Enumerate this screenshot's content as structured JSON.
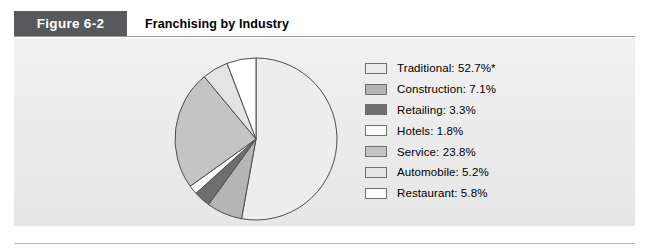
{
  "figure": {
    "badge_label": "Figure 6-2",
    "title": "Franchising by Industry"
  },
  "colors": {
    "badge_background": "#58595b",
    "panel_background": "#eeeeee",
    "rule": "#9a9a9a",
    "slice_outline": "#4d4d4d"
  },
  "chart_data": {
    "type": "pie",
    "title": "Franchising by Industry",
    "xlabel": "",
    "ylabel": "",
    "grid": false,
    "legend_position": "right",
    "start_angle_deg": 0,
    "direction": "clockwise",
    "units": "percent",
    "total": 99.7,
    "labels": [
      "Traditional",
      "Construction",
      "Retailing",
      "Hotels",
      "Service",
      "Automobile",
      "Restaurant"
    ],
    "values": [
      52.7,
      7.1,
      3.3,
      1.8,
      23.8,
      5.2,
      5.8
    ],
    "slice_colors": [
      "#ededed",
      "#b5b5b5",
      "#6e6e6e",
      "#fbfbfb",
      "#c4c4c4",
      "#e4e4e4",
      "#ffffff"
    ],
    "annotations": [
      "* Traditional value carries a footnote asterisk"
    ],
    "legend_entries": [
      {
        "label": "Traditional: 52.7%*",
        "swatch": "#ededed"
      },
      {
        "label": "Construction: 7.1%",
        "swatch": "#b5b5b5"
      },
      {
        "label": "Retailing: 3.3%",
        "swatch": "#6e6e6e"
      },
      {
        "label": "Hotels: 1.8%",
        "swatch": "#fbfbfb"
      },
      {
        "label": "Service: 23.8%",
        "swatch": "#c4c4c4"
      },
      {
        "label": "Automobile: 5.2%",
        "swatch": "#e4e4e4"
      },
      {
        "label": "Restaurant: 5.8%",
        "swatch": "#ffffff"
      }
    ]
  }
}
